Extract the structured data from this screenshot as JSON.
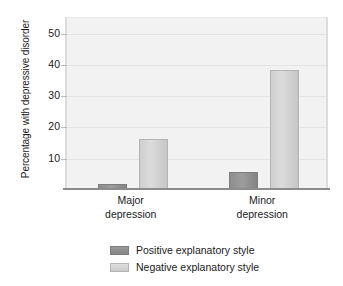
{
  "chart_data": {
    "type": "bar",
    "title": "",
    "subtitle": "",
    "xlabel": "",
    "ylabel": "Percentage with depressive disorder",
    "categories": [
      "Major depression",
      "Minor depression"
    ],
    "category_lines": [
      [
        "Major",
        "depression"
      ],
      [
        "Minor",
        "depression"
      ]
    ],
    "series": [
      {
        "name": "Positive explanatory style",
        "color": "#8e8e8e",
        "values": [
          1.5,
          5.5
        ]
      },
      {
        "name": "Negative explanatory style",
        "color": "#d4d4d4",
        "values": [
          16,
          38
        ]
      }
    ],
    "ylim": [
      0,
      55
    ],
    "yticks": [
      10,
      20,
      30,
      40,
      50
    ],
    "ytick_labels": [
      "10",
      "20",
      "30",
      "40",
      "50"
    ],
    "grid": true,
    "legend_position": "bottom",
    "plot_background": "#f2f2f2",
    "axis_color": "#8c8c8c",
    "gridline_color": "#e3e3e3"
  },
  "legend": {
    "items": [
      {
        "label": "Positive explanatory style",
        "swatch": "positive-swatch"
      },
      {
        "label": "Negative explanatory style",
        "swatch": "negative-swatch"
      }
    ]
  }
}
